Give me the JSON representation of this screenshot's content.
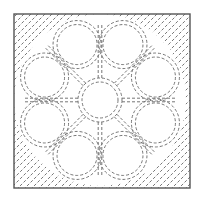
{
  "diagram": {
    "title": "Quilting stitch pattern — eight-petal flower in square frame",
    "frame": {
      "x": 14,
      "y": 14,
      "width": 176,
      "height": 174,
      "stroke": "#555555"
    },
    "center": {
      "cx": 100,
      "cy": 100
    },
    "center_circle": {
      "r_inner": 18,
      "r_outer": 22
    },
    "petal_count": 8,
    "petal_ring": {
      "radius": 60,
      "petal_radius": 20
    },
    "stitch_color": "#666666",
    "dash_pattern": "3 2",
    "corner_fill": "diagonal dashed stitch lines",
    "elements": [
      {
        "name": "frame",
        "label": "Square border"
      },
      {
        "name": "center-circle",
        "label": "Center circle (double stitched)"
      },
      {
        "name": "petals",
        "label": "Eight heart-shaped petals"
      },
      {
        "name": "radial-lines",
        "label": "Eight radial double stitch lines"
      },
      {
        "name": "corner-diagonals",
        "label": "Diagonal corner stitching"
      }
    ]
  }
}
